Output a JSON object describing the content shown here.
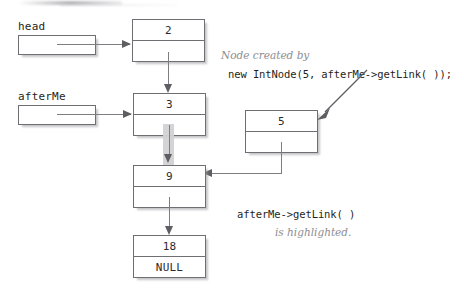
{
  "diagram": {
    "pointer_vars": [
      {
        "name": "head",
        "label": "head"
      },
      {
        "name": "afterMe",
        "label": "afterMe"
      }
    ],
    "nodes": [
      {
        "id": "node-2",
        "value": "2",
        "link": ""
      },
      {
        "id": "node-3",
        "value": "3",
        "link": ""
      },
      {
        "id": "node-5",
        "value": "5",
        "link": ""
      },
      {
        "id": "node-9",
        "value": "9",
        "link": ""
      },
      {
        "id": "node-18",
        "value": "18",
        "link": "NULL"
      }
    ],
    "annotations": [
      {
        "id": "note-created",
        "text": "Node created by",
        "style": "italic"
      },
      {
        "id": "code-new-intnode",
        "text": "new IntNode(5, afterMe->getLink( ));",
        "style": "code"
      },
      {
        "id": "code-getlink",
        "text": "afterMe->getLink( )",
        "style": "code"
      },
      {
        "id": "note-highlighted",
        "text": "is highlighted.",
        "style": "italic"
      }
    ],
    "colors": {
      "stroke": "#6f6f73",
      "connector": "#7d7d82",
      "arrowhead": "#5d5d62",
      "highlight": "#d2d2d4",
      "note_text": "#8d8d92",
      "code_text": "#1f1f21",
      "background": "#ffffff"
    }
  }
}
